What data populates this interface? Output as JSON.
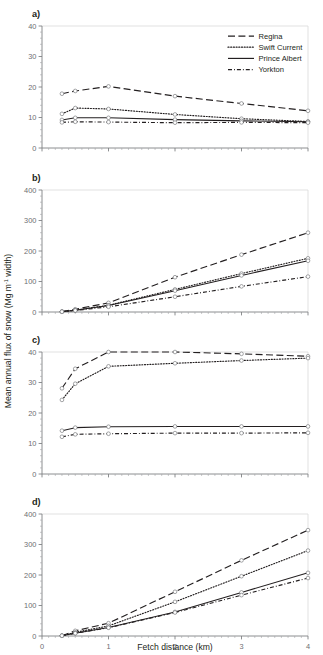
{
  "figure": {
    "xlabel": "Fetch distance (km)",
    "ylabel_main": "Mean annual flux of snow (Mg m",
    "ylabel_sup": "-1",
    "ylabel_tail": " width)",
    "panel_labels": [
      "a)",
      "b)",
      "c)",
      "d)"
    ]
  },
  "legend": {
    "position": "top-right-panel-a",
    "items": [
      {
        "label": "Regina",
        "dash": "longdash",
        "color": "#231f20"
      },
      {
        "label": "Swift Current",
        "dash": "dotted",
        "color": "#231f20"
      },
      {
        "label": "Prince Albert",
        "dash": "solid",
        "color": "#231f20"
      },
      {
        "label": "Yorkton",
        "dash": "dashdot",
        "color": "#231f20"
      }
    ]
  },
  "chart_data": [
    {
      "panel": "a)",
      "type": "line",
      "title": "",
      "xlabel": "",
      "ylabel": "",
      "xlim": [
        0,
        4
      ],
      "ylim": [
        0,
        40
      ],
      "xticks": [
        0,
        1,
        2,
        3,
        4
      ],
      "yticks": [
        0,
        10,
        20,
        30,
        40
      ],
      "grid": false,
      "x": [
        0.3,
        0.5,
        1.0,
        2.0,
        3.0,
        4.0
      ],
      "series": [
        {
          "name": "Regina",
          "dash": "longdash",
          "values": [
            17.8,
            18.7,
            20.2,
            17.0,
            14.6,
            12.2
          ]
        },
        {
          "name": "Swift Current",
          "dash": "dotted",
          "values": [
            11.2,
            13.1,
            12.8,
            11.0,
            9.6,
            8.7
          ]
        },
        {
          "name": "Prince Albert",
          "dash": "solid",
          "values": [
            9.2,
            9.9,
            9.9,
            9.3,
            8.9,
            8.6
          ]
        },
        {
          "name": "Yorkton",
          "dash": "dashdot",
          "values": [
            8.4,
            8.6,
            8.5,
            8.3,
            8.4,
            8.3
          ]
        }
      ]
    },
    {
      "panel": "b)",
      "type": "line",
      "title": "",
      "xlabel": "",
      "ylabel": "",
      "xlim": [
        0,
        4
      ],
      "ylim": [
        0,
        400
      ],
      "xticks": [
        0,
        1,
        2,
        3,
        4
      ],
      "yticks": [
        0,
        100,
        200,
        300,
        400
      ],
      "grid": false,
      "x": [
        0.3,
        0.5,
        1.0,
        2.0,
        3.0,
        4.0
      ],
      "series": [
        {
          "name": "Regina",
          "dash": "longdash",
          "values": [
            1,
            9,
            30,
            114,
            188,
            260
          ]
        },
        {
          "name": "Swift Current",
          "dash": "dotted",
          "values": [
            1,
            6,
            22,
            74,
            126,
            176
          ]
        },
        {
          "name": "Prince Albert",
          "dash": "solid",
          "values": [
            1,
            6,
            21,
            70,
            120,
            168
          ]
        },
        {
          "name": "Yorkton",
          "dash": "dashdot",
          "values": [
            1,
            5,
            17,
            50,
            84,
            116
          ]
        }
      ]
    },
    {
      "panel": "c)",
      "type": "line",
      "title": "",
      "xlabel": "",
      "ylabel": "",
      "xlim": [
        0,
        4
      ],
      "ylim": [
        0,
        40
      ],
      "xticks": [
        0,
        1,
        2,
        3,
        4
      ],
      "yticks": [
        0,
        10,
        20,
        30,
        40
      ],
      "grid": false,
      "x": [
        0.3,
        0.5,
        1.0,
        2.0,
        3.0,
        4.0
      ],
      "series": [
        {
          "name": "Regina",
          "dash": "longdash",
          "values": [
            28.1,
            34.5,
            40.0,
            40.0,
            39.4,
            38.6
          ]
        },
        {
          "name": "Swift Current",
          "dash": "dotted",
          "values": [
            24.3,
            29.6,
            35.3,
            36.3,
            37.2,
            38.0
          ]
        },
        {
          "name": "Prince Albert",
          "dash": "solid",
          "values": [
            14.2,
            15.2,
            15.5,
            15.6,
            15.6,
            15.6
          ]
        },
        {
          "name": "Yorkton",
          "dash": "dashdot",
          "values": [
            12.2,
            13.0,
            13.2,
            13.4,
            13.4,
            13.5
          ]
        }
      ]
    },
    {
      "panel": "d)",
      "type": "line",
      "title": "",
      "xlabel": "Fetch distance (km)",
      "ylabel": "",
      "xlim": [
        0,
        4
      ],
      "ylim": [
        0,
        400
      ],
      "xticks": [
        0,
        1,
        2,
        3,
        4
      ],
      "yticks": [
        0,
        100,
        200,
        300,
        400
      ],
      "grid": false,
      "x": [
        0.3,
        0.5,
        1.0,
        2.0,
        3.0,
        4.0
      ],
      "series": [
        {
          "name": "Regina",
          "dash": "longdash",
          "values": [
            1,
            17,
            42,
            145,
            248,
            347
          ]
        },
        {
          "name": "Swift Current",
          "dash": "dotted",
          "values": [
            1,
            12,
            33,
            112,
            196,
            280
          ]
        },
        {
          "name": "Prince Albert",
          "dash": "solid",
          "values": [
            1,
            9,
            28,
            79,
            143,
            207
          ]
        },
        {
          "name": "Yorkton",
          "dash": "dashdot",
          "values": [
            1,
            9,
            27,
            77,
            134,
            190
          ]
        }
      ]
    }
  ]
}
